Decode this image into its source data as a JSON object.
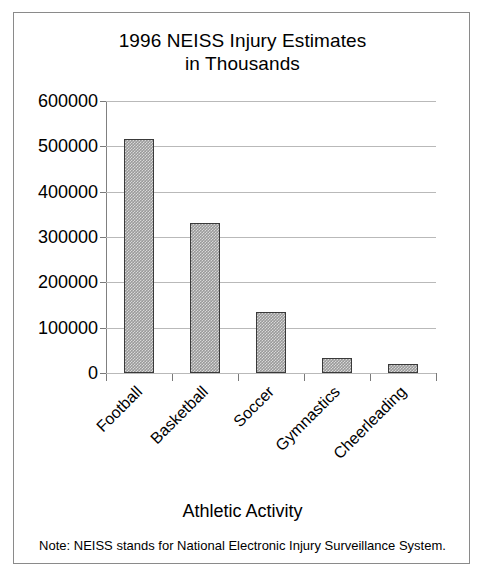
{
  "figure": {
    "title_line1": "1996 NEISS Injury Estimates",
    "title_line2": "in Thousands",
    "note": "Note: NEISS stands for National Electronic Injury Surveillance System.",
    "frame_color": "#8a8a8a",
    "bar_fill_color": "#9a9a9a",
    "bar_border_color": "#3a3a3a",
    "gridline_color": "#b9b9b9",
    "axis_color": "#808080"
  },
  "chart_data": {
    "type": "bar",
    "title": "1996 NEISS Injury Estimates in Thousands",
    "xlabel": "Athletic Activity",
    "ylabel": "",
    "categories": [
      "Football",
      "Basketball",
      "Soccer",
      "Gymnastics",
      "Cheerleading"
    ],
    "values": [
      516000,
      331000,
      135000,
      32000,
      20000
    ],
    "ylim": [
      0,
      600000
    ],
    "ytick_labels": [
      "600000",
      "500000",
      "400000",
      "300000",
      "200000",
      "100000",
      "0"
    ],
    "ytick_values": [
      600000,
      500000,
      400000,
      300000,
      200000,
      100000,
      0
    ],
    "grid": true,
    "legend": "none",
    "orientation": "vertical",
    "annotations": [
      "Note: NEISS stands for National Electronic Injury Surveillance System."
    ]
  }
}
